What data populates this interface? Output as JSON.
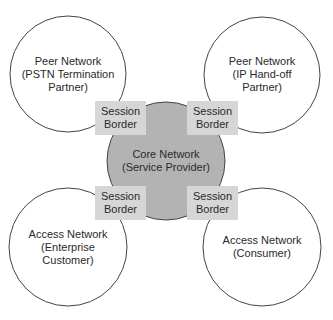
{
  "diagram": {
    "core": {
      "line1": "Core Network",
      "line2": "(Service Provider)",
      "fill": "#b3b3b3"
    },
    "nodes": [
      {
        "id": "top-left",
        "line1": "Peer Network",
        "line2": "(PSTN Termination",
        "line3": "Partner)"
      },
      {
        "id": "top-right",
        "line1": "Peer Network",
        "line2": "(IP Hand-off",
        "line3": "Partner)"
      },
      {
        "id": "bottom-left",
        "line1": "Access Network",
        "line2": "(Enterprise",
        "line3": "Customer)"
      },
      {
        "id": "bottom-right",
        "line1": "Access Network",
        "line2": "(Consumer)"
      }
    ],
    "borders": [
      {
        "line1": "Session",
        "line2": "Border"
      },
      {
        "line1": "Session",
        "line2": "Border"
      },
      {
        "line1": "Session",
        "line2": "Border"
      },
      {
        "line1": "Session",
        "line2": "Border"
      }
    ],
    "border_fill": "#d6d6d6"
  }
}
